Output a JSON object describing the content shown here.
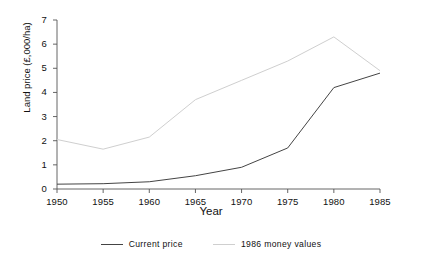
{
  "chart_data": {
    "type": "line",
    "title": "",
    "xlabel": "Year",
    "ylabel": "Land price (£,000/ha)",
    "x": [
      1950,
      1955,
      1960,
      1965,
      1970,
      1975,
      1980,
      1985
    ],
    "xticklabels": [
      "1950",
      "1955",
      "1960",
      "1965",
      "1970",
      "1975",
      "1980",
      "1985"
    ],
    "yticklabels": [
      "0",
      "1",
      "2",
      "3",
      "4",
      "5",
      "6",
      "7"
    ],
    "xlim": [
      1950,
      1985
    ],
    "ylim": [
      0,
      7
    ],
    "grid": false,
    "legend_position": "bottom-center",
    "series": [
      {
        "name": "Current price",
        "color": "#444444",
        "values": [
          0.2,
          0.22,
          0.3,
          0.55,
          0.9,
          1.7,
          4.2,
          4.8
        ]
      },
      {
        "name": "1986 money values",
        "color": "#cfcfcf",
        "values": [
          2.05,
          1.65,
          2.15,
          3.7,
          4.5,
          5.3,
          6.3,
          4.9
        ]
      }
    ]
  },
  "axis": {
    "line_color": "#555555"
  },
  "legend": {
    "entries": [
      {
        "label": "Current price"
      },
      {
        "label": "1986 money values"
      }
    ]
  }
}
